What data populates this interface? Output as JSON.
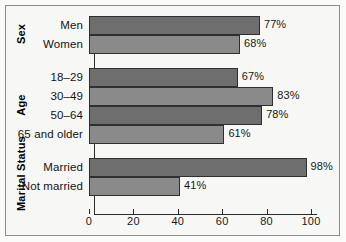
{
  "chart_data": {
    "type": "bar",
    "orientation": "horizontal",
    "title": "",
    "subtitle": "",
    "xlabel": "",
    "ylabel": "",
    "xlim": [
      0,
      100
    ],
    "xticks": [
      0,
      20,
      40,
      60,
      80,
      100
    ],
    "xtick_labels": [
      "0",
      "20",
      "40",
      "60",
      "80",
      "100"
    ],
    "grid": false,
    "legend": "none",
    "value_suffix": "%",
    "groups": [
      {
        "title": "Sex",
        "categories": [
          "Men",
          "Women"
        ],
        "values": [
          77,
          68
        ],
        "value_labels": [
          "77%",
          "68%"
        ]
      },
      {
        "title": "Age",
        "categories": [
          "18–29",
          "30–49",
          "50–64",
          "65 and older"
        ],
        "values": [
          67,
          83,
          78,
          61
        ],
        "value_labels": [
          "67%",
          "83%",
          "78%",
          "61%"
        ]
      },
      {
        "title": "Marital Status",
        "categories": [
          "Married",
          "Not married"
        ],
        "values": [
          98,
          41
        ],
        "value_labels": [
          "98%",
          "41%"
        ]
      }
    ],
    "categories": [
      "Men",
      "Women",
      "18–29",
      "30–49",
      "50–64",
      "65 and older",
      "Married",
      "Not married"
    ],
    "values": [
      77,
      68,
      67,
      83,
      78,
      61,
      98,
      41
    ],
    "colors": {
      "bar_dark": "#6e6e6e",
      "bar_light": "#8a8a8a",
      "bar_edge": "#2f2f2f",
      "axis": "#2b2b2b",
      "frame": "#8d8d8d",
      "background": "#f7f7f5",
      "text": "#141414"
    }
  }
}
